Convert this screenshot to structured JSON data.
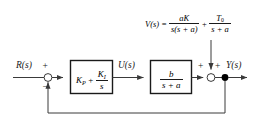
{
  "diagram": {
    "type": "control-system-block-diagram",
    "colors": {
      "line": "#3a3a3a",
      "text": "#1a1a1a",
      "background": "#ffffff",
      "node_fill": "#000000",
      "sum_fill": "#ffffff"
    },
    "signals": {
      "reference": "R(s)",
      "control": "U(s)",
      "output": "Y(s)",
      "disturbance": "V(s)"
    },
    "equation": {
      "lhs": "V(s)",
      "equals": "=",
      "term1": {
        "numerator": "aK",
        "denominator": "s(s + a)"
      },
      "operator": "+",
      "term2": {
        "numerator": "T",
        "numerator_sub": "0",
        "denominator": "s + a"
      }
    },
    "blocks": [
      {
        "id": "controller",
        "name": "pi-controller-block",
        "term1": "K",
        "term1_sub": "P",
        "operator": "+",
        "numerator": "K",
        "numerator_sub": "I",
        "denominator": "s"
      },
      {
        "id": "plant",
        "name": "plant-block",
        "numerator": "b",
        "denominator": "s + a"
      }
    ],
    "summing_junctions": [
      {
        "id": "error-sum",
        "sign_top": "+",
        "sign_bottom": "−"
      },
      {
        "id": "output-sum",
        "sign_left": "+",
        "sign_right": "+"
      }
    ]
  }
}
